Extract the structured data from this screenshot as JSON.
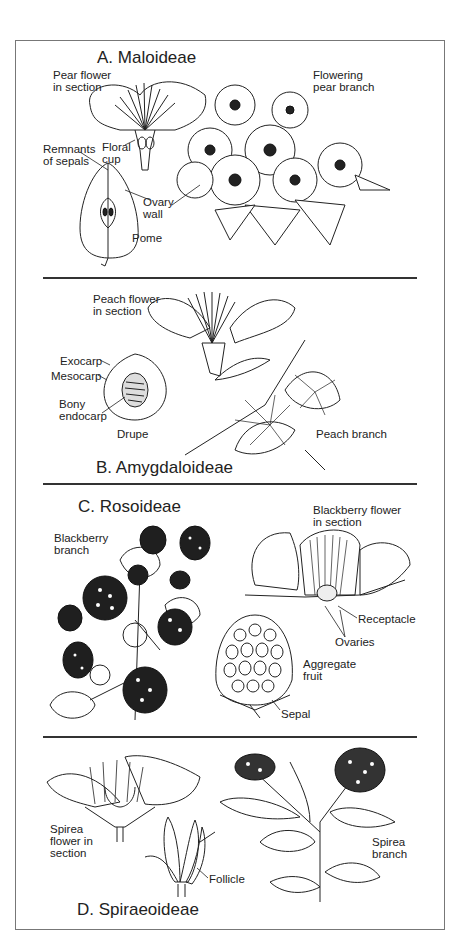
{
  "figure": {
    "sections": [
      {
        "id": "A",
        "title": "A. Maloideae",
        "labels": {
          "pear_flower": "Pear flower\nin section",
          "flowering_branch": "Flowering\npear branch",
          "remnants": "Remnants\nof sepals",
          "floral_cup": "Floral\ncup",
          "ovary_wall": "Ovary\nwall",
          "pome": "Pome"
        }
      },
      {
        "id": "B",
        "title": "B. Amygdaloideae",
        "labels": {
          "peach_flower": "Peach flower\nin section",
          "exocarp": "Exocarp",
          "mesocarp": "Mesocarp",
          "bony_endocarp": "Bony\nendocarp",
          "drupe": "Drupe",
          "peach_branch": "Peach branch"
        }
      },
      {
        "id": "C",
        "title": "C. Rosoideae",
        "labels": {
          "blackberry_branch": "Blackberry\nbranch",
          "blackberry_flower": "Blackberry flower\nin section",
          "receptacle": "Receptacle",
          "ovaries": "Ovaries",
          "aggregate_fruit": "Aggregate\nfruit",
          "sepal": "Sepal"
        }
      },
      {
        "id": "D",
        "title": "D. Spiraeoideae",
        "labels": {
          "spirea_flower": "Spirea\nflower in\nsection",
          "follicle": "Follicle",
          "spirea_branch": "Spirea\nbranch"
        }
      }
    ]
  }
}
